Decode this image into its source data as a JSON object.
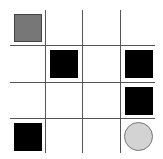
{
  "board": {
    "rows": 4,
    "cols": 4,
    "grid_color": "#555555",
    "pieces": [
      {
        "row": 0,
        "col": 0,
        "type": "square",
        "color": "#777777",
        "name": "gray-square-piece"
      },
      {
        "row": 1,
        "col": 1,
        "type": "square",
        "color": "#000000",
        "name": "black-square-piece"
      },
      {
        "row": 1,
        "col": 3,
        "type": "square",
        "color": "#000000",
        "name": "black-square-piece"
      },
      {
        "row": 2,
        "col": 3,
        "type": "square",
        "color": "#000000",
        "name": "black-square-piece"
      },
      {
        "row": 3,
        "col": 0,
        "type": "square",
        "color": "#000000",
        "name": "black-square-piece"
      },
      {
        "row": 3,
        "col": 3,
        "type": "circle",
        "color": "#d3d3d3",
        "name": "gray-circle-piece"
      }
    ]
  }
}
